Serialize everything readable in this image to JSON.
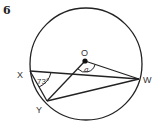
{
  "problem_number": "6",
  "points": {
    "O": {
      "label": "O"
    },
    "X": {
      "label": "X"
    },
    "W": {
      "label": "W"
    },
    "Y": {
      "label": "Y"
    }
  },
  "angles": {
    "at_X": "73°",
    "at_O": "a"
  },
  "colors": {
    "stroke": "#222222",
    "background": "#ffffff"
  }
}
